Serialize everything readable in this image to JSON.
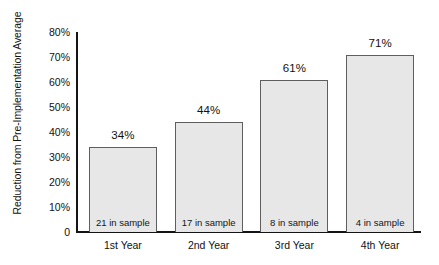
{
  "chart_data": {
    "type": "bar",
    "title": "",
    "subtitle": "",
    "xlabel": "",
    "ylabel": "Reduction from Pre-Implementation Average",
    "categories": [
      "1st Year",
      "2nd Year",
      "3rd Year",
      "4th Year"
    ],
    "values": [
      34,
      44,
      61,
      71
    ],
    "value_labels": [
      "34%",
      "44%",
      "61%",
      "71%"
    ],
    "bar_annotations": [
      "21 in sample",
      "17 in sample",
      "8 in sample",
      "4 in sample"
    ],
    "sample_sizes": [
      21,
      17,
      8,
      4
    ],
    "ylim": [
      0,
      80
    ],
    "y_ticks": [
      80,
      70,
      60,
      50,
      40,
      30,
      20,
      10,
      0
    ],
    "y_tick_labels": [
      "80%",
      "70%",
      "60%",
      "50%",
      "40%",
      "30%",
      "20%",
      "10%",
      "0"
    ],
    "grid": false,
    "legend": false,
    "legend_position": "none",
    "colors": {
      "bar_fill": "#e7e7e7",
      "bar_border": "#5e5e5e",
      "axis": "#141414",
      "text": "#111111",
      "background": "#ffffff"
    }
  }
}
